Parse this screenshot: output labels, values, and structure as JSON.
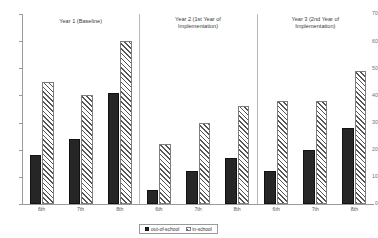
{
  "chart_data": {
    "type": "bar",
    "title": "",
    "xlabel": "",
    "ylabel": "",
    "ylim": [
      0,
      70
    ],
    "ytick_step": 10,
    "yticks": [
      0,
      10,
      20,
      30,
      40,
      50,
      60,
      70
    ],
    "grid": false,
    "legend_position": "bottom",
    "categories": [
      "6th",
      "7th",
      "8th",
      "6th",
      "7th",
      "8th",
      "6th",
      "7th",
      "8th"
    ],
    "groups": [
      {
        "label": "Year 1 (Baseline)",
        "label_line1": "Year 1 (Baseline)",
        "label_line2": "",
        "categories": [
          "6th",
          "7th",
          "8th"
        ]
      },
      {
        "label": "Year 2 (1st Year of Implementation)",
        "label_line1": "Year 2 (1st Year of",
        "label_line2": "Implementation)",
        "categories": [
          "6th",
          "7th",
          "8th"
        ]
      },
      {
        "label": "Year 3 (2nd Year of Implementation)",
        "label_line1": "Year 3 (2nd Year of",
        "label_line2": "Implementation)",
        "categories": [
          "6th",
          "7th",
          "8th"
        ]
      }
    ],
    "series": [
      {
        "name": "out-of-school",
        "color": "#262626",
        "pattern": "solid",
        "values": [
          18,
          24,
          41,
          5,
          12,
          17,
          12,
          20,
          28
        ]
      },
      {
        "name": "in-school",
        "color": "#ffffff",
        "pattern": "diagonal-hatch",
        "values": [
          45,
          40,
          60,
          22,
          30,
          36,
          38,
          38,
          49
        ]
      }
    ]
  },
  "legend": {
    "items": [
      {
        "label": "out-of-school",
        "swatch": "solid-dark"
      },
      {
        "label": "in-school",
        "swatch": "hatched"
      }
    ]
  },
  "axis": {
    "y_ticks": [
      "0",
      "10",
      "20",
      "30",
      "40",
      "50",
      "60",
      "70"
    ]
  }
}
